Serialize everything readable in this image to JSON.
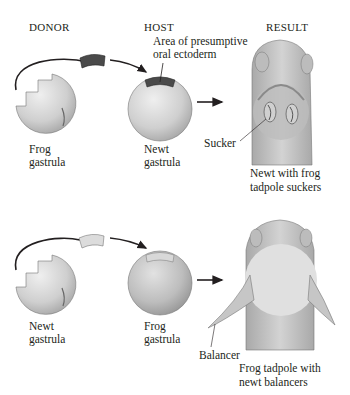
{
  "headers": {
    "donor": "DONOR",
    "host": "HOST",
    "result": "RESULT"
  },
  "top": {
    "donor_label_1": "Frog",
    "donor_label_2": "gastrula",
    "host_label_1": "Newt",
    "host_label_2": "gastrula",
    "area_label_1": "Area of presumptive",
    "area_label_2": "oral ectoderm",
    "part_label": "Sucker",
    "result_label_1": "Newt with frog",
    "result_label_2": "tadpole suckers"
  },
  "bottom": {
    "donor_label_1": "Newt",
    "donor_label_2": "gastrula",
    "host_label_1": "Frog",
    "host_label_2": "gastrula",
    "part_label": "Balancer",
    "result_label_1": "Frog tadpole with",
    "result_label_2": "newt balancers"
  },
  "colors": {
    "sphere": "#d6d6d6",
    "sphere_dark": "#a8a8a8",
    "graft_dark": "#4a4a4a",
    "graft_light": "#d9d9d9",
    "body": "#c8c8c8",
    "belly": "#dcdcdc",
    "ink": "#231f20"
  }
}
